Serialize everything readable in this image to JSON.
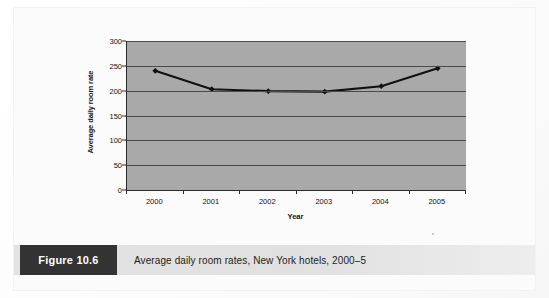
{
  "figure": {
    "tag_label": "Figure 10.6",
    "caption": "Average daily room rates, New York hotels, 2000–5"
  },
  "chart_data": {
    "type": "line",
    "title": "",
    "xlabel": "Year",
    "ylabel": "Average daily room rate",
    "categories": [
      "2000",
      "2001",
      "2002",
      "2003",
      "2004",
      "2005"
    ],
    "values": [
      240,
      203,
      199,
      198,
      209,
      245
    ],
    "series": [
      {
        "name": "Average daily room rate",
        "values": [
          240,
          203,
          199,
          198,
          209,
          245
        ]
      }
    ],
    "ylim": [
      0,
      300
    ],
    "ytick_labels": [
      "0",
      "50",
      "100",
      "150",
      "200",
      "250",
      "300"
    ],
    "ytick_values": [
      0,
      50,
      100,
      150,
      200,
      250,
      300
    ],
    "grid": "horizontal",
    "legend": "none",
    "marker": "diamond",
    "colors": {
      "plot_background": "#a9a9a9",
      "gridline": "#4a4a4a",
      "axis": "#2b2b2b",
      "line": "#111111",
      "caption_tag_background": "#333333",
      "caption_bar_background": "#e3e3e3"
    }
  }
}
